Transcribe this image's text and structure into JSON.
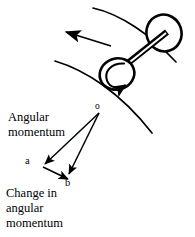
{
  "figure": {
    "background_color": "#ffffff",
    "stroke_color": "#000000",
    "width": 195,
    "height": 237
  },
  "labels": {
    "angular_momentum": "Angular\nmomentum",
    "change_in_angular_momentum": "Change in\nangular\nmomentum",
    "point_o": "o",
    "point_a": "a",
    "point_b": "b"
  },
  "diagram": {
    "path_arcs": [
      {
        "name": "outer-curved-track",
        "description": "upper arc of curved path",
        "d": "M 93 8 C 120 14 150 34 176 62"
      },
      {
        "name": "inner-curved-track",
        "description": "lower arc of curved path",
        "d": "M 55 61 C 85 70 120 92 152 133"
      }
    ],
    "motion_arrow": {
      "name": "direction-of-motion-arrow",
      "from_x": 111,
      "from_y": 46,
      "to_x": 63,
      "to_y": 31
    },
    "axle": {
      "name": "wheel-axle",
      "x1": 113,
      "y1": 74,
      "x2": 166,
      "y2": 32,
      "thickness": 5
    },
    "wheels": [
      {
        "name": "upper-wheel",
        "cx": 164,
        "cy": 33,
        "rx": 17,
        "ry": 18,
        "rotation": -18
      },
      {
        "name": "lower-wheel",
        "cx": 117,
        "cy": 74,
        "rx": 17,
        "ry": 15,
        "rotation": -18
      }
    ],
    "spin_arrow": {
      "name": "spin-direction-arrow",
      "description": "counterclockwise spin arc inside lower wheel",
      "d": "M 123 64 C 110 63 104 72 107 80 C 110 87 118 89 124 85"
    },
    "vectors": [
      {
        "name": "vector-oa",
        "label": "Angular momentum",
        "from_x": 99,
        "from_y": 113,
        "to_x": 43,
        "to_y": 166
      },
      {
        "name": "vector-ob",
        "label": "",
        "from_x": 99,
        "from_y": 113,
        "to_x": 68,
        "to_y": 176
      },
      {
        "name": "vector-ab",
        "label": "Change in angular momentum",
        "from_x": 43,
        "from_y": 166,
        "to_x": 69,
        "to_y": 181
      }
    ]
  }
}
